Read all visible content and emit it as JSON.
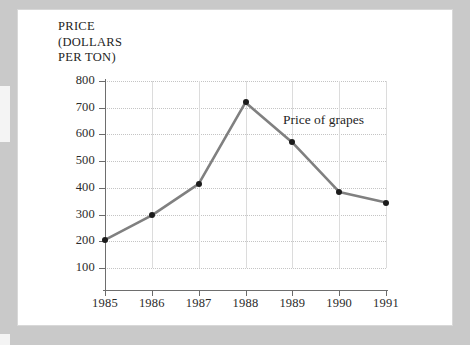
{
  "chart_data": {
    "type": "line",
    "title": "",
    "xlabel": "",
    "ylabel": "PRICE (DOLLARS PER TON)",
    "ylabel_lines": [
      "PRICE",
      "(DOLLARS",
      "PER TON)"
    ],
    "categories": [
      "1985",
      "1986",
      "1987",
      "1988",
      "1989",
      "1990",
      "1991"
    ],
    "x": [
      1985,
      1986,
      1987,
      1988,
      1989,
      1990,
      1991
    ],
    "ylim": [
      0,
      800
    ],
    "xlim": [
      1985,
      1991
    ],
    "yticks": [
      100,
      200,
      300,
      400,
      500,
      600,
      700,
      800
    ],
    "ytick_labels": [
      "100",
      "200",
      "300",
      "400",
      "500",
      "600",
      "700",
      "800"
    ],
    "xtick_labels": [
      "1985",
      "1986",
      "1987",
      "1988",
      "1989",
      "1990",
      "1991"
    ],
    "grid": true,
    "grid_horizontal_style": "dotted",
    "grid_vertical_style": "solid",
    "legend_position": "inline-annotation",
    "series": [
      {
        "name": "Price of grapes",
        "values": [
          205,
          297,
          415,
          720,
          570,
          385,
          345
        ],
        "line_color": "#808080",
        "marker_color": "#1c1c1c"
      }
    ],
    "annotations": [
      {
        "text": "Price of grapes",
        "x": 1989,
        "y": 640
      }
    ]
  },
  "colors": {
    "page_background": "#b9b9b9",
    "paper": "#ffffff",
    "axis": "#6e6e6e",
    "gridline_horizontal": "#c4c4c4",
    "gridline_vertical": "#dcdcdc",
    "series_line": "#808080",
    "marker": "#1c1c1c",
    "text": "#232323"
  }
}
